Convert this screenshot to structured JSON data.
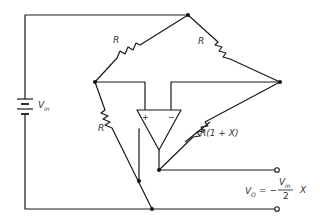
{
  "diagram": {
    "type": "bridge-amplifier-circuit",
    "labels": {
      "r_top_left": "R",
      "r_top_right": "R",
      "r_bottom_left": "R",
      "r_bottom_right": "R(1 + X)",
      "source_v": "V",
      "source_sub": "in",
      "opamp_plus": "+",
      "opamp_minus": "−",
      "out_v": "V",
      "out_sub": "O",
      "out_eq": "= −",
      "frac_num_v": "V",
      "frac_num_sub": "in",
      "frac_den": "2",
      "out_x": "X"
    },
    "components": [
      {
        "id": "battery",
        "kind": "dc-source",
        "label": "Vin"
      },
      {
        "id": "r1",
        "kind": "resistor",
        "label": "R"
      },
      {
        "id": "r2",
        "kind": "resistor",
        "label": "R"
      },
      {
        "id": "r3",
        "kind": "resistor",
        "label": "R"
      },
      {
        "id": "r4",
        "kind": "variable-resistor",
        "label": "R(1 + X)"
      },
      {
        "id": "opamp",
        "kind": "op-amp",
        "inputs": [
          "+",
          "−"
        ]
      }
    ],
    "output_equation": "VO = −(Vin/2) X"
  }
}
